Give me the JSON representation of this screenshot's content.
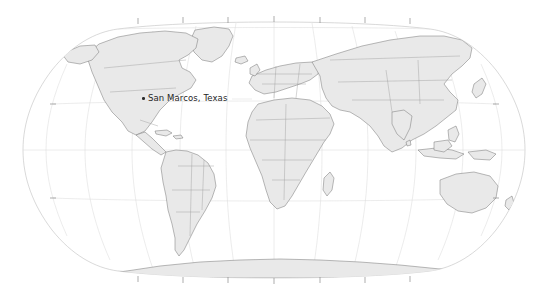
{
  "figure": {
    "type": "map",
    "projection": "robinson",
    "background_color": "#ffffff",
    "land_fill_color": "#e9e9e9",
    "border_color": "#8c8c8c",
    "coastline_color": "#6e6e6e",
    "graticule_color": "#d6d6d6",
    "outline_color": "#b4b4b4",
    "tick_color": "#8a8a8a",
    "label_color": "#262626"
  },
  "graticule": {
    "longitude_step_degrees": 30,
    "latitude_step_degrees": 30,
    "longitude_lines": [
      -180,
      -150,
      -120,
      -90,
      -60,
      -30,
      0,
      30,
      60,
      90,
      120,
      150,
      180
    ],
    "latitude_lines": [
      -60,
      -30,
      0,
      30,
      60
    ],
    "show_grid": true
  },
  "ticks": {
    "top": [
      138,
      183,
      228,
      274,
      320,
      365,
      410
    ],
    "bottom": [
      138,
      183,
      228,
      274,
      320,
      365,
      410
    ],
    "left": [
      104,
      198
    ],
    "right": [
      104,
      198
    ],
    "show_tick_labels": false
  },
  "markers": [
    {
      "name": "San Marcos, Texas",
      "label": "San Marcos, Texas",
      "dot_x": 142,
      "dot_y": 98,
      "label_x": 148,
      "label_y": 94
    }
  ]
}
